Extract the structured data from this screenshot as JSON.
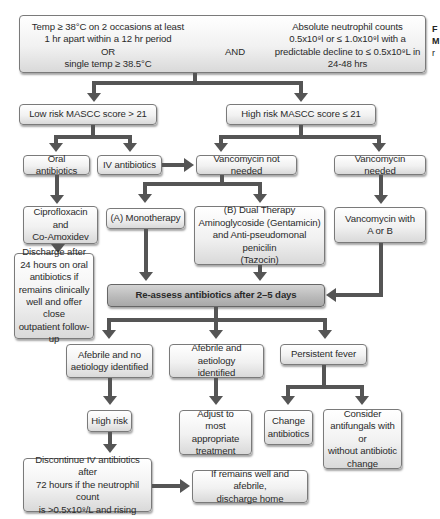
{
  "criteria": {
    "temp_lines": [
      "Temp ≥ 38°C on 2 occasions at least",
      "1 hr apart within a 12 hr period",
      "OR",
      "single temp ≥ 38.5°C"
    ],
    "connector": "AND",
    "anc_lines": [
      "Absolute neutrophil counts",
      "0.5x10⁹l or ≤ 1.0x10⁹l with a",
      "predictable decline to ≤ 0.5x10⁹L in",
      "24-48 hrs"
    ]
  },
  "side_caption": [
    "F",
    "M",
    "r"
  ],
  "risk": {
    "low": "Low risk MASCC score > 21",
    "high": "High risk MASCC score ≤ 21"
  },
  "low_branch": {
    "oral": "Oral antibiotics",
    "iv": "IV antibiotics",
    "cipro": [
      "Ciprofloxacin and",
      "Co-Amoxidev"
    ],
    "discharge": [
      "Discharge after",
      "24 hours on oral",
      "antibiotics if",
      "remains clinically",
      "well and offer close",
      "outpatient follow-up"
    ]
  },
  "high_branch": {
    "vanc_not_needed": "Vancomycin not needed",
    "vanc_needed": "Vancomycin needed",
    "monotherapy": "(A) Monotherapy",
    "dual": [
      "(B) Dual Therapy",
      "Aminoglycoside (Gentamicin)",
      "and Anti-pseudomonal penicilin",
      "(Tazocin)"
    ],
    "vanc_with": [
      "Vancomycin with",
      "A or B"
    ]
  },
  "reassess": "Re-assess antibiotics after 2–5 days",
  "outcomes": {
    "afebrile_no": [
      "Afebrile and no",
      "aetiology identified"
    ],
    "afebrile_yes": [
      "Afebrile and aetiology",
      "identified"
    ],
    "persistent": "Persistent fever",
    "high_risk": "High risk",
    "adjust": [
      "Adjust to",
      "most appropriate",
      "treatment"
    ],
    "change": [
      "Change",
      "antibiotics"
    ],
    "consider": [
      "Consider",
      "antifungals with or",
      "without antibiotic",
      "change"
    ],
    "discontinue": [
      "Discontinue IV antibiotics after",
      "72 hours if the neutrophil count",
      "is >0.5x10⁹/L and rising"
    ],
    "discharge_home": [
      "If remains well and afebrile,",
      "discharge home"
    ]
  }
}
